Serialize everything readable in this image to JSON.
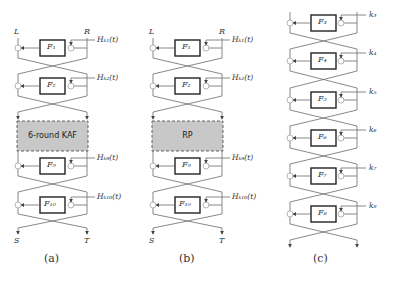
{
  "diagram_a": {
    "input_left": "L",
    "input_right": "R",
    "output_left": "S",
    "output_right": "T",
    "rounds": [
      {
        "f": "F₁",
        "key": "Hₖ₁(t)"
      },
      {
        "f": "F₂",
        "key": "Hₖ₂(t)"
      },
      {
        "f": "F₉",
        "key": "Hₖ₉(t)"
      },
      {
        "f": "F₁₀",
        "key": "Hₖ₁₀(t)"
      }
    ],
    "middle_block": "6-round KAF",
    "caption": "(a)"
  },
  "diagram_b": {
    "input_left": "L",
    "input_right": "R",
    "output_left": "S",
    "output_right": "T",
    "rounds": [
      {
        "f": "F₁",
        "key": "Hₖ₁(t)"
      },
      {
        "f": "F₂",
        "key": "Hₖ₂(t)"
      },
      {
        "f": "F₉",
        "key": "Hₖ₉(t)"
      },
      {
        "f": "F₁₀",
        "key": "Hₖ₁₀(t)"
      }
    ],
    "middle_block": "RP",
    "caption": "(b)"
  },
  "diagram_c": {
    "rounds": [
      {
        "f": "F₃",
        "key": "k₃"
      },
      {
        "f": "F₄",
        "key": "k₄"
      },
      {
        "f": "F₅",
        "key": "k₅"
      },
      {
        "f": "F₆",
        "key": "k₆"
      },
      {
        "f": "F₇",
        "key": "k₇"
      },
      {
        "f": "F₈",
        "key": "k₈"
      }
    ],
    "caption": "(c)"
  }
}
